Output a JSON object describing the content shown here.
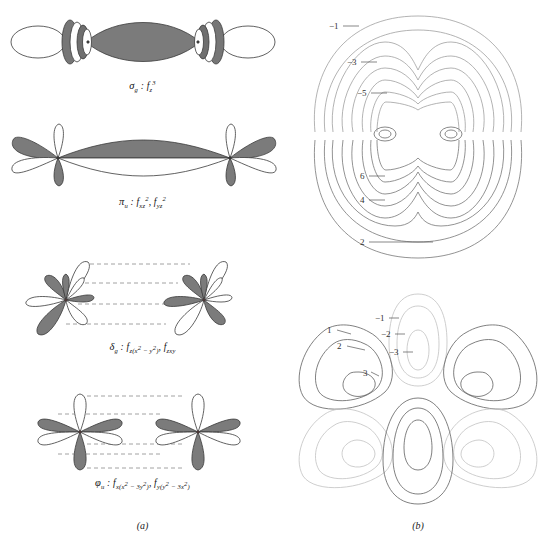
{
  "figure": {
    "panel_a": {
      "caption": "(a)",
      "orbitals": [
        {
          "name": "sigma-g-overlap",
          "symmetry": "σ",
          "symmetry_sub": "g",
          "orbital_text": "f",
          "orbital_sub": "z",
          "orbital_sup": "3",
          "label_plain": "σg : fz3",
          "lobes": 8,
          "description": "end-on sigma overlap of two f z-cubed orbitals with central gray lens and toroidal rings"
        },
        {
          "name": "pi-u-overlap",
          "symmetry": "π",
          "symmetry_sub": "u",
          "orbital_text": "f",
          "orbital_sub_1": "xz",
          "orbital_sup_1": "2",
          "orbital_sub_2": "yz",
          "orbital_sup_2": "2",
          "label_plain": "πu : fxz2, fyz2",
          "lobes": 8,
          "description": "side-on pi overlap, upper gray lobes and lower white lobes"
        },
        {
          "name": "delta-g-overlap",
          "symmetry": "δ",
          "symmetry_sub": "g",
          "orbital_text": "f",
          "orbital_sub_1": "z(x",
          "orbital_sup_1": "2",
          "orbital_mid_1": " − y",
          "orbital_sup_2": "2",
          "orbital_tail_1": ")",
          "orbital_sub_2": "zxy",
          "label_plain": "δg : fz(x2 − y2), fzxy",
          "lobes": 8,
          "description": "delta overlap of eight-lobed f orbitals with four dashed correlation lines"
        },
        {
          "name": "phi-u-overlap",
          "symmetry": "φ",
          "symmetry_sub": "u",
          "orbital_text": "f",
          "orbital_sub_1": "x(x",
          "orbital_sup_1": "2",
          "orbital_mid_1": " − 3y",
          "orbital_sup_2": "2",
          "orbital_tail_1": ")",
          "orbital_sub_2": "y(y",
          "orbital_sup_3": "2",
          "orbital_mid_2": " − 3x",
          "orbital_sup_4": "2",
          "orbital_tail_2": ")",
          "label_plain": "φu : fx(x2 − 3y2), fy(y2 − 3x2)",
          "lobes": 6,
          "description": "phi overlap of six-lobed f orbitals with five dashed correlation lines"
        }
      ]
    },
    "panel_b": {
      "caption": "(b)",
      "plots": [
        {
          "name": "sigma-contour-map",
          "description": "contour map of two-center sigma f-orbital electron density",
          "contour_labels_upper": [
            "−1",
            "−3",
            "−5"
          ],
          "contour_labels_lower": [
            "6",
            "4",
            "2"
          ]
        },
        {
          "name": "phi-contour-map",
          "description": "contour map of phi f-orbital electron density with six lobes",
          "contour_labels_left": [
            "1",
            "2",
            "3"
          ],
          "contour_labels_center": [
            "−1",
            "−2",
            "−3"
          ]
        }
      ]
    }
  },
  "colors": {
    "lobe_shaded": "#7b7b7b",
    "lobe_unshaded": "#ffffff",
    "stroke": "#3a3a3a",
    "contour_solid": "#555555",
    "contour_light": "#b9b9b9",
    "dashed_line": "#8a8a8a",
    "text": "#1a1a1a",
    "background": "#ffffff"
  }
}
